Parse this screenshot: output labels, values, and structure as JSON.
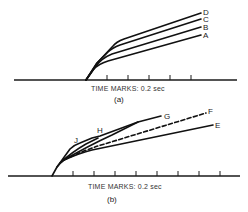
{
  "panels": [
    {
      "id": "a",
      "caption": "TIME MARKS: 0.2 sec",
      "sublabel": "(a)",
      "curves": [
        {
          "label": "D",
          "style": "solid"
        },
        {
          "label": "C",
          "style": "solid"
        },
        {
          "label": "B",
          "style": "solid"
        },
        {
          "label": "A",
          "style": "solid"
        }
      ],
      "tick_count": 5
    },
    {
      "id": "b",
      "caption": "TIME MARKS: 0.2 sec",
      "sublabel": "(b)",
      "curves": [
        {
          "label": "G",
          "style": "solid"
        },
        {
          "label": "F",
          "style": "dashed"
        },
        {
          "label": "E",
          "style": "solid"
        }
      ],
      "point_labels": [
        {
          "label": "J"
        },
        {
          "label": "H"
        }
      ],
      "tick_count": 8
    }
  ]
}
